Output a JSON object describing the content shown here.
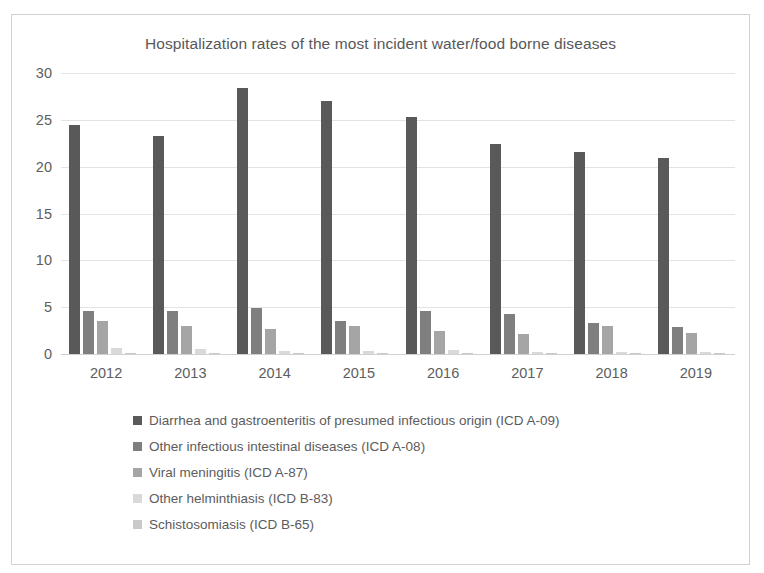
{
  "page": {
    "top_bleed_text": "              "
  },
  "chart_data": {
    "type": "bar",
    "title": "Hospitalization rates of the most incident water/food borne diseases",
    "xlabel": "",
    "ylabel": "",
    "ylim": [
      0,
      30
    ],
    "yticks": [
      0,
      5,
      10,
      15,
      20,
      25,
      30
    ],
    "ytick_labels": [
      "0",
      "5",
      "10",
      "15",
      "20",
      "25",
      "30"
    ],
    "grid": true,
    "legend_position": "bottom",
    "categories": [
      "2012",
      "2013",
      "2014",
      "2015",
      "2016",
      "2017",
      "2018",
      "2019"
    ],
    "series": [
      {
        "name": "Diarrhea and gastroenteritis of presumed infectious origin (ICD A-09)",
        "color": "#595959",
        "values": [
          24.4,
          23.3,
          28.4,
          27.0,
          25.3,
          22.4,
          21.6,
          20.9
        ]
      },
      {
        "name": "Other infectious intestinal diseases (ICD A-08)",
        "color": "#7f7f7f",
        "values": [
          4.6,
          4.6,
          4.9,
          3.5,
          4.6,
          4.3,
          3.3,
          2.9
        ]
      },
      {
        "name": "Viral meningitis (ICD A-87)",
        "color": "#a5a5a5",
        "values": [
          3.5,
          3.0,
          2.7,
          3.0,
          2.5,
          2.1,
          3.0,
          2.2
        ]
      },
      {
        "name": "Other helminthiasis (ICD B-83)",
        "color": "#d9d9d9",
        "values": [
          0.6,
          0.5,
          0.3,
          0.35,
          0.4,
          0.25,
          0.2,
          0.2
        ]
      },
      {
        "name": "Schistosomiasis (ICD B-65)",
        "color": "#c9c9c9",
        "values": [
          0.1,
          0.08,
          0.08,
          0.08,
          0.08,
          0.06,
          0.05,
          0.05
        ]
      }
    ]
  }
}
